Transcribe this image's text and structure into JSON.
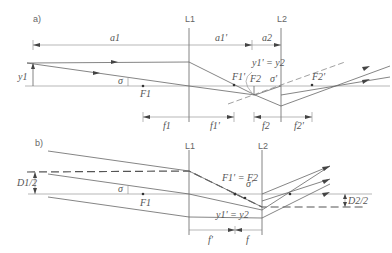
{
  "diagram": {
    "type": "optics-ray-diagram",
    "colors": {
      "line": "#666666",
      "text": "#555555",
      "background": "#ffffff"
    },
    "panel_a": {
      "label": "a)",
      "lens1": "L1",
      "lens2": "L2",
      "distance_a1": "a1",
      "distance_a1_prime": "a1'",
      "distance_a2": "a2",
      "object_height": "y1",
      "angle": "σ",
      "angle_prime": "σ'",
      "focal_F1": "F1",
      "focal_F1_prime": "F1'",
      "focal_F2": "F2",
      "focal_F2_prime": "F2'",
      "image_eq": "y1' = y2",
      "focal_len_f1": "f1",
      "focal_len_f1_prime": "f1'",
      "focal_len_f2": "f2",
      "focal_len_f2_prime": "f2'"
    },
    "panel_b": {
      "label": "b)",
      "lens1": "L1",
      "lens2": "L2",
      "beam_half_d1": "D1/2",
      "beam_half_d2": "D2/2",
      "angle": "σ",
      "angle_prime": "σ'",
      "focal_F1": "F1",
      "focal_eq": "F1' = F2",
      "image_eq": "y1' = y2",
      "focal_len_f1_prime": "f'",
      "focal_len_f2": "f"
    }
  }
}
